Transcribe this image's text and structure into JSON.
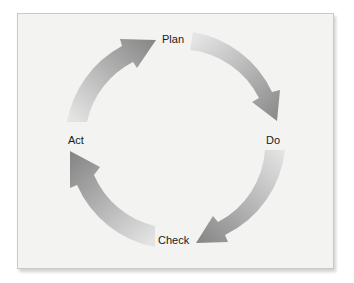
{
  "diagram": {
    "type": "cycle",
    "nodes": [
      {
        "id": "plan",
        "label": "Plan"
      },
      {
        "id": "do",
        "label": "Do"
      },
      {
        "id": "check",
        "label": "Check"
      },
      {
        "id": "act",
        "label": "Act"
      }
    ],
    "edges": [
      {
        "from": "plan",
        "to": "do"
      },
      {
        "from": "do",
        "to": "check"
      },
      {
        "from": "check",
        "to": "act"
      },
      {
        "from": "act",
        "to": "plan"
      }
    ],
    "colors": {
      "frame_bg": "#f3f3f2",
      "frame_border": "#c9c9c9",
      "arrow_light": "#e2e2e2",
      "arrow_dark": "#8a8a8a",
      "label": "#1a1a1a"
    }
  }
}
